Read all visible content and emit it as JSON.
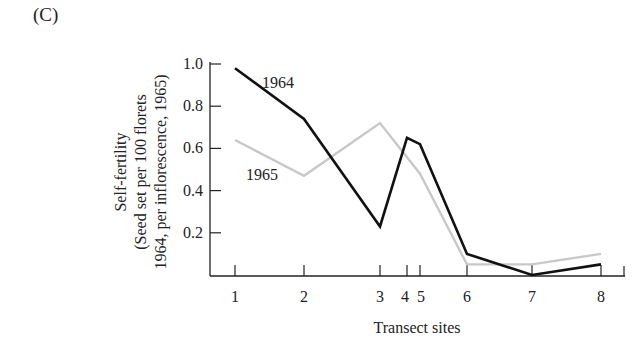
{
  "panel_label": "(C)",
  "chart_data": {
    "type": "line",
    "title": "",
    "xlabel": "Transect sites",
    "ylabel": [
      "Self-fertility",
      "(Seed set per 100 florets",
      "1964, per inflorescence, 1965)"
    ],
    "x": [
      1,
      2,
      3,
      4,
      5,
      6,
      7,
      8
    ],
    "x_tick_labels": [
      "1",
      "2",
      "3",
      "4",
      "5",
      "6",
      "7",
      "8"
    ],
    "y_tick_labels": [
      "1.0",
      "0.8",
      "0.6",
      "0.4",
      "0.2"
    ],
    "ylim": [
      0,
      1.0
    ],
    "grid": false,
    "legend": "inline labels",
    "series": [
      {
        "name": "1964",
        "color": "#111111",
        "x": [
          1,
          2,
          3,
          4,
          5,
          6,
          7,
          8
        ],
        "values": [
          0.98,
          0.74,
          0.23,
          0.65,
          0.62,
          0.1,
          0.0,
          0.05
        ]
      },
      {
        "name": "1965",
        "color": "#c8c8c8",
        "x": [
          1,
          2,
          3,
          5,
          6,
          7,
          8
        ],
        "values": [
          0.64,
          0.47,
          0.72,
          0.48,
          0.05,
          0.05,
          0.1
        ]
      }
    ]
  }
}
